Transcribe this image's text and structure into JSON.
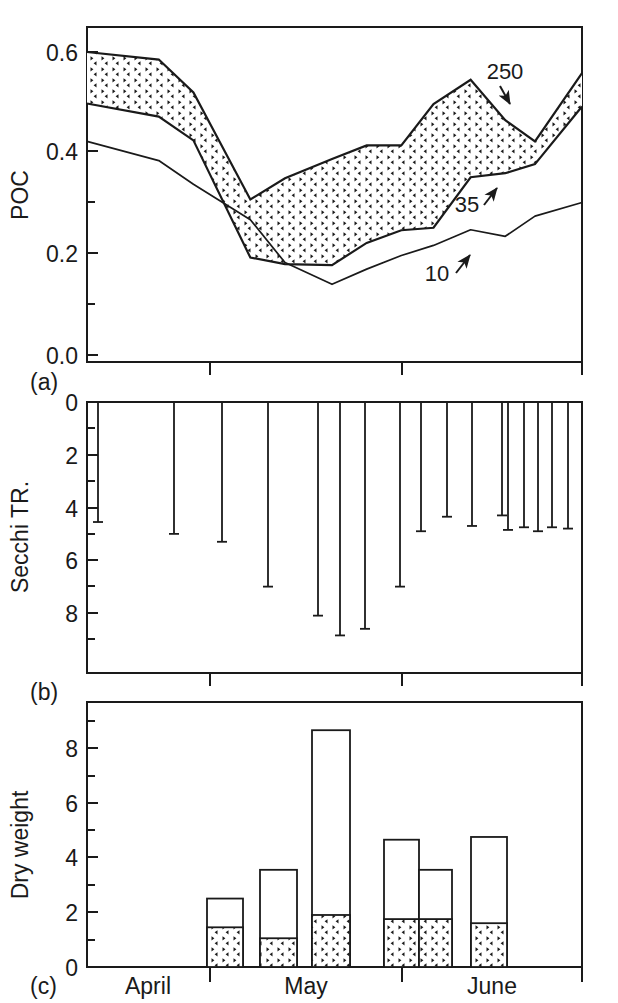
{
  "figure": {
    "type": "multi-panel-scientific-figure",
    "background_color": "#ffffff",
    "line_color": "#1a1a1a",
    "hatch_color": "#1a1a1a"
  },
  "panels": [
    {
      "id": "a",
      "letter": "(a)",
      "ylabel": "POC",
      "ytick_labels": [
        "0.6",
        "0.4",
        "0.2",
        "0.0"
      ]
    },
    {
      "id": "b",
      "letter": "(b)",
      "ylabel": "Secchi TR.",
      "ytick_labels": [
        "0",
        "2",
        "4",
        "6",
        "8"
      ]
    },
    {
      "id": "c",
      "letter": "(c)",
      "ylabel": "Dry weight",
      "ytick_labels": [
        "8",
        "6",
        "4",
        "2",
        "0"
      ]
    }
  ],
  "xaxis": {
    "month_labels": [
      "April",
      "May",
      "June"
    ]
  },
  "chart_data": [
    {
      "type": "area",
      "panel": "a",
      "title": "",
      "xlabel": "",
      "ylabel": "POC",
      "ylim": [
        0.0,
        0.66
      ],
      "ytick_values": [
        0.6,
        0.4,
        0.2,
        0.0
      ],
      "yminor_values": [
        0.5,
        0.3,
        0.1
      ],
      "grid": false,
      "legend_position": "inline-annotations",
      "annotations": [
        {
          "label": "250",
          "points_to": "upper-shaded-boundary"
        },
        {
          "label": "35",
          "points_to": "lower-shaded-boundary"
        },
        {
          "label": "10",
          "points_to": "bottom-line"
        }
      ],
      "x": [
        0.0,
        0.145,
        0.215,
        0.33,
        0.4,
        0.495,
        0.565,
        0.635,
        0.7,
        0.775,
        0.845,
        0.905,
        1.0
      ],
      "series": [
        {
          "name": "250",
          "values": [
            0.6,
            0.585,
            0.52,
            0.308,
            0.35,
            0.388,
            0.415,
            0.415,
            0.497,
            0.545,
            0.465,
            0.423,
            0.558
          ]
        },
        {
          "name": "35",
          "values": [
            0.498,
            0.472,
            0.425,
            0.193,
            0.18,
            0.178,
            0.222,
            0.247,
            0.252,
            0.352,
            0.36,
            0.378,
            0.492
          ]
        },
        {
          "name": "10",
          "values": [
            0.423,
            0.385,
            0.338,
            0.268,
            0.183,
            0.14,
            0.17,
            0.197,
            0.217,
            0.248,
            0.235,
            0.275,
            0.302
          ]
        }
      ]
    },
    {
      "type": "bar",
      "panel": "b",
      "title": "",
      "xlabel": "",
      "ylabel": "Secchi TR.",
      "ylim": [
        0,
        10.3
      ],
      "y_inverted": true,
      "ytick_values": [
        0,
        2,
        4,
        6,
        8
      ],
      "yminor_values": [
        1,
        3,
        5,
        7,
        9
      ],
      "grid": false,
      "orientation": "hanging-drop-lines-from-top",
      "categories": [
        "1",
        "2",
        "3",
        "4",
        "5",
        "6",
        "7",
        "8",
        "9",
        "10",
        "11",
        "12",
        "13",
        "14",
        "15",
        "16",
        "17",
        "18",
        "19",
        "20"
      ],
      "values": [
        4.55,
        5.0,
        5.3,
        7.0,
        8.1,
        8.85,
        8.6,
        7.0,
        4.9,
        4.35,
        4.7,
        4.3,
        4.85,
        4.75,
        4.8,
        4.7,
        4.9,
        4.75,
        4.75
      ],
      "x_positions": [
        0.028,
        0.328,
        0.448,
        0.688,
        0.978,
        1.0,
        1.0,
        1.0,
        1.0,
        1.0,
        1.0,
        1.0,
        1.0,
        1.0,
        1.0,
        1.0,
        1.0,
        1.0,
        1.0
      ]
    },
    {
      "type": "bar",
      "panel": "c",
      "title": "",
      "xlabel": "",
      "ylabel": "Dry weight",
      "ylim": [
        0,
        10.3
      ],
      "ytick_values": [
        8,
        6,
        4,
        2,
        0
      ],
      "yminor_values": [
        9,
        7,
        5,
        3,
        1
      ],
      "grid": false,
      "stacked": true,
      "categories": [
        "bar1",
        "bar2",
        "bar3",
        "bar4",
        "bar5",
        "bar6"
      ],
      "series": [
        {
          "name": "hatched-lower",
          "values": [
            1.45,
            1.05,
            1.9,
            1.75,
            1.75,
            1.6
          ]
        },
        {
          "name": "open-upper-total",
          "values": [
            2.5,
            3.55,
            8.65,
            4.65,
            3.55,
            4.75
          ]
        }
      ]
    }
  ]
}
